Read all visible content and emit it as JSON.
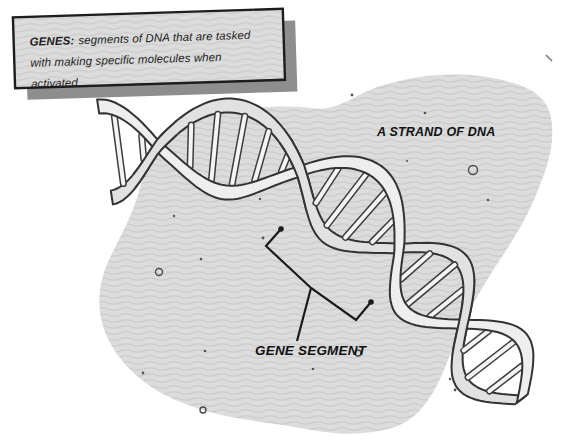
{
  "figure": {
    "background": "#ffffff",
    "title_box": {
      "term": "GENES:",
      "definition": "segments of DNA that are tasked with making specific molecules when activated"
    },
    "labels": {
      "strand": "A STRAND OF DNA",
      "segment": "GENE SEGMENT"
    },
    "colors": {
      "blob_fill": "#dcdcdc",
      "blob_wave": "#cbcbcb",
      "panel_fill": "#dcdcdc",
      "panel_border": "#1d1d1d",
      "panel_shadow": "#8e8e8e",
      "ink": "#1d1d1d",
      "ribbon_front": "#eeeeee",
      "ribbon_back": "#e1e1e1",
      "ribbon_outline": "#333333",
      "rung_fill": "#f4f4f4",
      "rung_outline": "#3d3d3d",
      "speck": "#555555"
    }
  }
}
